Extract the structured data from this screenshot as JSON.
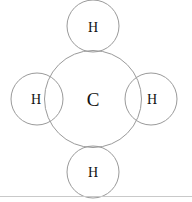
{
  "diagram": {
    "type": "molecule-diagram",
    "background_color": "#ffffff",
    "circle_stroke_color": "#9a9a9a",
    "circle_stroke_width": 1,
    "label_color": "#111111",
    "bottom_rule_color": "#c9c9c9",
    "atoms": [
      {
        "id": "carbon-center",
        "label": "C",
        "element": "C",
        "role": "central-atom",
        "cx": 93,
        "cy": 99,
        "r": 48.5,
        "font_size": 19,
        "label_dx": 0,
        "label_dy": 0
      },
      {
        "id": "hydrogen-top",
        "label": "H",
        "element": "H",
        "role": "bonded-atom",
        "cx": 93,
        "cy": 26,
        "r": 26,
        "font_size": 14,
        "label_dx": 0,
        "label_dy": 1
      },
      {
        "id": "hydrogen-left",
        "label": "H",
        "element": "H",
        "role": "bonded-atom",
        "cx": 37,
        "cy": 99,
        "r": 26,
        "font_size": 14,
        "label_dx": -1,
        "label_dy": 0
      },
      {
        "id": "hydrogen-right",
        "label": "H",
        "element": "H",
        "role": "bonded-atom",
        "cx": 151,
        "cy": 99,
        "r": 26,
        "font_size": 14,
        "label_dx": 1,
        "label_dy": 0
      },
      {
        "id": "hydrogen-bottom",
        "label": "H",
        "element": "H",
        "role": "bonded-atom",
        "cx": 93,
        "cy": 172,
        "r": 26,
        "font_size": 14,
        "label_dx": 0,
        "label_dy": 0
      }
    ],
    "bottom_rule": {
      "x1": 0,
      "x2": 192,
      "y": 196.5
    }
  }
}
